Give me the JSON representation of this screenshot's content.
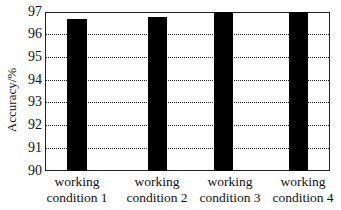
{
  "chart_data": {
    "type": "bar",
    "title": "",
    "xlabel": "",
    "ylabel": "Accuracy/%",
    "ylim": [
      90,
      97
    ],
    "yticks": [
      90,
      91,
      92,
      93,
      94,
      95,
      96,
      97
    ],
    "grid": "horizontal dotted",
    "legend": null,
    "categories": [
      "working condition 1",
      "working condition 2",
      "working condition 3",
      "working condition 4"
    ],
    "category_lines": [
      [
        "working",
        "condition 1"
      ],
      [
        "working",
        "condition 2"
      ],
      [
        "working",
        "condition 3"
      ],
      [
        "working",
        "condition 4"
      ]
    ],
    "values": [
      96.7,
      96.8,
      97.0,
      97.0
    ],
    "bar_color": "#000000"
  },
  "axis": {
    "ylabel": "Accuracy/%",
    "yticks": [
      "97",
      "96",
      "95",
      "94",
      "93",
      "92",
      "91",
      "90"
    ]
  },
  "xlabels": [
    {
      "line1": "working",
      "line2": "condition 1"
    },
    {
      "line1": "working",
      "line2": "condition 2"
    },
    {
      "line1": "working",
      "line2": "condition 3"
    },
    {
      "line1": "working",
      "line2": "condition 4"
    }
  ]
}
